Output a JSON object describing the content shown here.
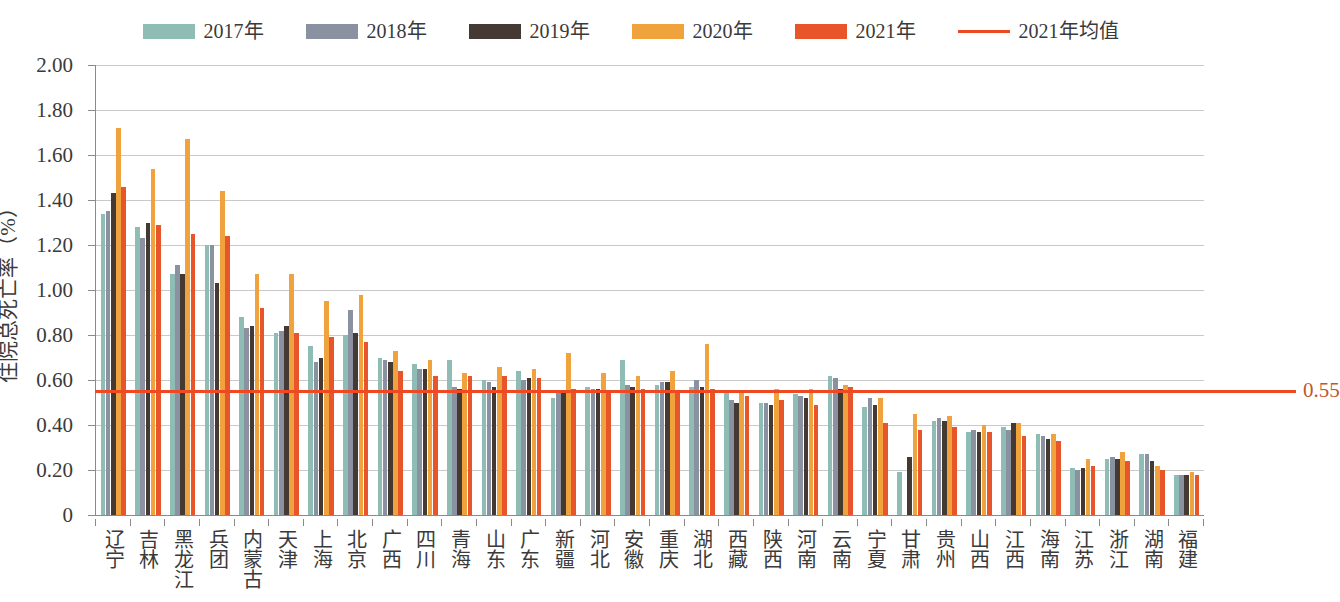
{
  "legend": {
    "items": [
      {
        "label": "2017年",
        "color": "#8fbdb5",
        "type": "swatch",
        "name": "legend-2017"
      },
      {
        "label": "2018年",
        "color": "#8a92a2",
        "type": "swatch",
        "name": "legend-2018"
      },
      {
        "label": "2019年",
        "color": "#453a33",
        "type": "swatch",
        "name": "legend-2019"
      },
      {
        "label": "2020年",
        "color": "#f0a23d",
        "type": "swatch",
        "name": "legend-2020"
      },
      {
        "label": "2021年",
        "color": "#e8552a",
        "type": "swatch",
        "name": "legend-2021"
      },
      {
        "label": "2021年均值",
        "color": "#ef4923",
        "type": "line",
        "name": "legend-2021-mean"
      }
    ]
  },
  "mean_label": "0.55",
  "chart_data": {
    "type": "bar",
    "title": "",
    "subtitle": "",
    "xlabel": "",
    "ylabel": "住院总死亡率（%）",
    "ylim": [
      0,
      2.0
    ],
    "ytick_labels": [
      "0",
      "0.20",
      "0.40",
      "0.60",
      "0.80",
      "1.00",
      "1.20",
      "1.40",
      "1.60",
      "1.80",
      "2.00"
    ],
    "ytick_values": [
      0,
      0.2,
      0.4,
      0.6,
      0.8,
      1.0,
      1.2,
      1.4,
      1.6,
      1.8,
      2.0
    ],
    "grid": true,
    "legend_position": "top-center",
    "reference_line": {
      "label": "2021年均值",
      "value": 0.55,
      "display_value": "0.55",
      "color": "#ef4923"
    },
    "categories": [
      "辽宁",
      "吉林",
      "黑龙江",
      "兵团",
      "内蒙古",
      "天津",
      "上海",
      "北京",
      "广西",
      "四川",
      "青海",
      "山东",
      "广东",
      "新疆",
      "河北",
      "安徽",
      "重庆",
      "湖北",
      "西藏",
      "陕西",
      "河南",
      "云南",
      "宁夏",
      "甘肃",
      "贵州",
      "山西",
      "江西",
      "海南",
      "江苏",
      "浙江",
      "湖南",
      "福建"
    ],
    "series": [
      {
        "name": "2017年",
        "color": "#8fbdb5",
        "values": [
          1.34,
          1.28,
          1.07,
          1.2,
          0.88,
          0.81,
          0.75,
          0.8,
          0.7,
          0.67,
          0.69,
          0.6,
          0.64,
          0.52,
          0.57,
          0.69,
          0.58,
          0.57,
          0.55,
          0.5,
          0.54,
          0.62,
          0.48,
          0.19,
          0.42,
          0.37,
          0.39,
          0.36,
          0.21,
          0.25,
          0.27,
          0.18
        ]
      },
      {
        "name": "2018年",
        "color": "#8a92a2",
        "values": [
          1.35,
          1.23,
          1.11,
          1.2,
          0.83,
          0.82,
          0.68,
          0.91,
          0.69,
          0.65,
          0.57,
          0.59,
          0.6,
          0.55,
          0.56,
          0.58,
          0.59,
          0.6,
          0.51,
          0.5,
          0.53,
          0.61,
          0.52,
          0.0,
          0.43,
          0.38,
          0.38,
          0.35,
          0.2,
          0.26,
          0.27,
          0.18
        ]
      },
      {
        "name": "2019年",
        "color": "#453a33",
        "values": [
          1.43,
          1.3,
          1.07,
          1.03,
          0.84,
          0.84,
          0.7,
          0.81,
          0.68,
          0.65,
          0.56,
          0.57,
          0.61,
          0.55,
          0.56,
          0.57,
          0.59,
          0.57,
          0.5,
          0.49,
          0.52,
          0.56,
          0.49,
          0.26,
          0.42,
          0.37,
          0.41,
          0.34,
          0.21,
          0.25,
          0.24,
          0.18
        ]
      },
      {
        "name": "2020年",
        "color": "#f0a23d",
        "values": [
          1.72,
          1.54,
          1.67,
          1.44,
          1.07,
          1.07,
          0.95,
          0.98,
          0.73,
          0.69,
          0.63,
          0.66,
          0.65,
          0.72,
          0.63,
          0.62,
          0.64,
          0.76,
          0.55,
          0.56,
          0.56,
          0.58,
          0.52,
          0.45,
          0.44,
          0.4,
          0.41,
          0.36,
          0.25,
          0.28,
          0.22,
          0.19
        ]
      },
      {
        "name": "2021年",
        "color": "#e8552a",
        "values": [
          1.46,
          1.29,
          1.25,
          1.24,
          0.92,
          0.81,
          0.79,
          0.77,
          0.64,
          0.62,
          0.62,
          0.62,
          0.61,
          0.56,
          0.55,
          0.56,
          0.55,
          0.56,
          0.53,
          0.51,
          0.49,
          0.57,
          0.41,
          0.38,
          0.39,
          0.37,
          0.35,
          0.33,
          0.22,
          0.24,
          0.2,
          0.18
        ]
      }
    ]
  }
}
